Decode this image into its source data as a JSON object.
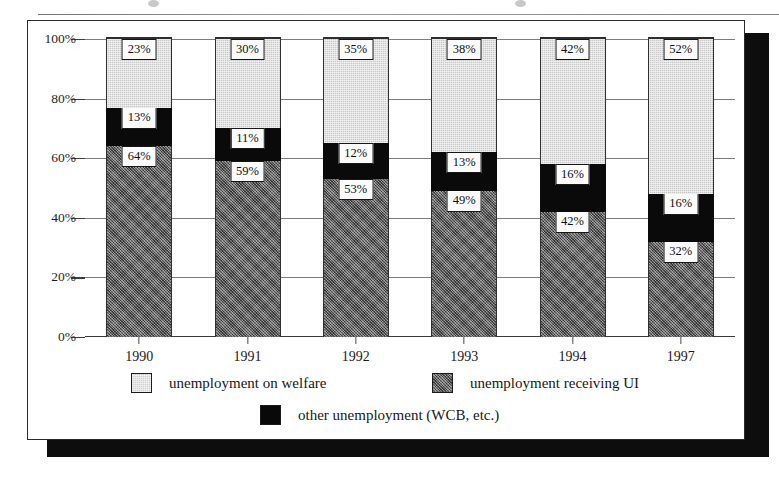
{
  "chart_data": {
    "type": "bar",
    "subtype": "stacked-column-100",
    "title": "",
    "xlabel": "",
    "ylabel": "",
    "categories": [
      "1990",
      "1991",
      "1992",
      "1993",
      "1994",
      "1997"
    ],
    "series": [
      {
        "name": "unemployment receiving UI",
        "key": "ui",
        "color": "#5d5d5d",
        "values": [
          64,
          59,
          53,
          49,
          42,
          32
        ]
      },
      {
        "name": "other unemployment (WCB, etc.)",
        "key": "other",
        "color": "#090909",
        "values": [
          13,
          11,
          12,
          13,
          16,
          16
        ]
      },
      {
        "name": "unemployment on welfare",
        "key": "welfare",
        "color": "#cfcfcf",
        "values": [
          23,
          30,
          35,
          38,
          42,
          52
        ]
      }
    ],
    "value_labels": {
      "ui": [
        "64%",
        "59%",
        "53%",
        "49%",
        "42%",
        "32%"
      ],
      "other": [
        "13%",
        "11%",
        "12%",
        "13%",
        "16%",
        "16%"
      ],
      "welfare": [
        "23%",
        "30%",
        "35%",
        "38%",
        "42%",
        "52%"
      ]
    },
    "ylim": [
      0,
      100
    ],
    "yticks": [
      0,
      20,
      40,
      60,
      80,
      100
    ],
    "ytick_labels": [
      "0%",
      "20%",
      "40%",
      "60%",
      "80%",
      "100%"
    ],
    "grid": true,
    "legend_position": "bottom",
    "legend": [
      {
        "label": "unemployment on welfare",
        "swatch": "welfare-swatch"
      },
      {
        "label": "unemployment receiving UI",
        "swatch": "ui-swatch"
      },
      {
        "label": "other unemployment (WCB, etc.)",
        "swatch": "other-swatch"
      }
    ]
  }
}
